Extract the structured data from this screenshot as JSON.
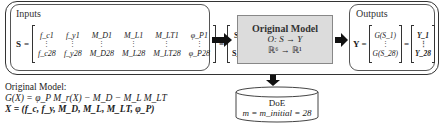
{
  "inputs": {
    "title": "Inputs",
    "lhs": "S",
    "matrix_first_row": [
      "f_c1",
      "f_y1",
      "M_D1",
      "M_L1",
      "M_LT1",
      "φ_P1"
    ],
    "matrix_last_row": [
      "f_c28",
      "f_y28",
      "M_D28",
      "M_L28",
      "M_LT28",
      "φ_P28"
    ],
    "vector": [
      "S_1",
      "⋮",
      "S_28"
    ]
  },
  "model": {
    "title": "Original Model",
    "mapping": "O: S → Y",
    "dimension": "ℝ⁶ → ℝ¹"
  },
  "outputs": {
    "title": "Outputs",
    "lhs": "Y",
    "vector_g": [
      "G(S_1)",
      "⋮",
      "G(S_28)"
    ],
    "vector_y": [
      "Y_1",
      "⋮",
      "Y_28"
    ]
  },
  "doe": {
    "title": "DoE",
    "formula": "m = m_initial = 28"
  },
  "note": {
    "title": "Original Model:",
    "equation": "G(X) = φ_P M_r(X) − M_D − M_L M_LT",
    "variables": "X = (f_c, f_y, M_D, M_L, M_LT, φ_P)"
  },
  "colors": {
    "model_fill": "#dcdcdc",
    "border": "#333333",
    "arrow": "#111111"
  }
}
